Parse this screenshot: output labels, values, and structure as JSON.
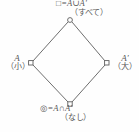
{
  "diagram": {
    "type": "lattice-hasse-diagram",
    "shape": "diamond",
    "stroke_color": "#6e6e6e",
    "text_color": "#575757",
    "background_color": "#fefefe",
    "nodes": [
      {
        "id": "top",
        "position": "top",
        "x": 70,
        "y": 20,
        "marker": "open-circle",
        "symbol": "□=A∪A′",
        "annotation": "（すべて）"
      },
      {
        "id": "left",
        "position": "left",
        "x": 31,
        "y": 63,
        "marker": "open-square",
        "symbol": "A",
        "annotation": "（小）"
      },
      {
        "id": "right",
        "position": "right",
        "x": 107,
        "y": 63,
        "marker": "open-square",
        "symbol": "A′",
        "annotation": "（大）"
      },
      {
        "id": "bottom",
        "position": "bottom",
        "x": 70,
        "y": 104,
        "marker": "open-square",
        "symbol": "◎=A∩A′",
        "annotation": "（なし）"
      }
    ],
    "edges": [
      {
        "from": "top",
        "to": "left"
      },
      {
        "from": "top",
        "to": "right"
      },
      {
        "from": "left",
        "to": "bottom"
      },
      {
        "from": "right",
        "to": "bottom"
      }
    ]
  }
}
